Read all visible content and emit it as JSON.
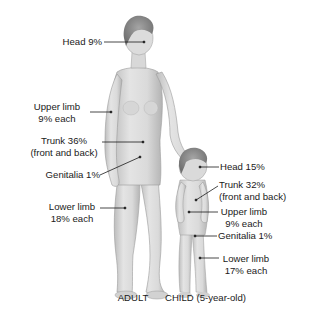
{
  "diagram": {
    "type": "body-surface-area-rule-of-nines",
    "figures": [
      {
        "id": "adult",
        "caption": "ADULT",
        "regions": [
          {
            "name": "head",
            "line1": "Head 9%",
            "line2": ""
          },
          {
            "name": "upper-limb",
            "line1": "Upper limb",
            "line2": "9% each"
          },
          {
            "name": "trunk",
            "line1": "Trunk 36%",
            "line2": "(front and back)"
          },
          {
            "name": "genitalia",
            "line1": "Genitalia 1%",
            "line2": ""
          },
          {
            "name": "lower-limb",
            "line1": "Lower limb",
            "line2": "18% each"
          }
        ]
      },
      {
        "id": "child",
        "caption": "CHILD (5-year-old)",
        "regions": [
          {
            "name": "head",
            "line1": "Head 15%",
            "line2": ""
          },
          {
            "name": "trunk",
            "line1": "Trunk 32%",
            "line2": "(front and back)"
          },
          {
            "name": "upper-limb",
            "line1": "Upper limb",
            "line2": "9% each"
          },
          {
            "name": "genitalia",
            "line1": "Genitalia 1%",
            "line2": ""
          },
          {
            "name": "lower-limb",
            "line1": "Lower limb",
            "line2": "17% each"
          }
        ]
      }
    ]
  },
  "colors": {
    "background": "#ffffff",
    "skin_light": "#e6e6e6",
    "skin_mid": "#cfcfcf",
    "skin_dark": "#a9a9a9",
    "hair": "#8a8a8a",
    "line": "#1a1a1a",
    "text": "#1a1a1a"
  }
}
